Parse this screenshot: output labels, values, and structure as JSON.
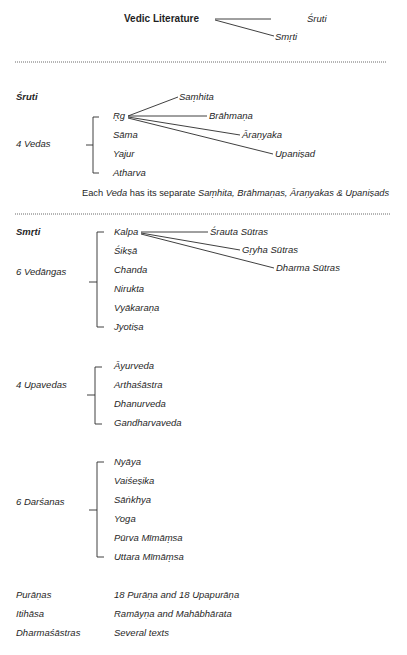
{
  "header": {
    "root": "Vedic Literature",
    "branches": [
      "Śruti",
      "Smṛti"
    ]
  },
  "sruti": {
    "heading": "Śruti",
    "group_label": "4 Vedas",
    "vedas": [
      "Ṛg",
      "Sāma",
      "Yajur",
      "Atharva"
    ],
    "rg_branches": [
      "Saṃhita",
      "Brāhmaṇa",
      "Āraṇyaka",
      "Upaniṣad"
    ],
    "note": {
      "prefix": "Each ",
      "veda": "Veda",
      "middle": " has its separate ",
      "parts": "Saṃhita, Brāhmaṇas, Āraṇyakas & Upaniṣads"
    }
  },
  "smrti": {
    "heading": "Smṛti",
    "vedangas": {
      "label": "6 Vedāngas",
      "items": [
        "Kalpa",
        "Śikṣā",
        "Chanda",
        "Nirukta",
        "Vyākaraṇa",
        "Jyotiṣa"
      ],
      "kalpa_branches": [
        "Śrauta Sūtras",
        "Gṛyha Sūtras",
        "Dharma Sūtras"
      ]
    },
    "upavedas": {
      "label": "4 Upavedas",
      "items": [
        "Āyurveda",
        "Arthaśāstra",
        "Dhanurveda",
        "Gandharvaveda"
      ]
    },
    "darsanas": {
      "label": "6 Darśanas",
      "items": [
        "Nyāya",
        "Vaiśeṣika",
        "Sāṅkhya",
        "Yoga",
        "Pūrva Mīmāṃsa",
        "Uttara Mīmāṃsa"
      ]
    },
    "others": [
      {
        "label": "Purāṇas",
        "value": "18 Purāṇa and 18 Upapurāṇa"
      },
      {
        "label": "Itihāsa",
        "value": "Ramāyṇa and Mahābhārata"
      },
      {
        "label": "Dharmaśāstras",
        "value": "Several texts"
      }
    ]
  }
}
